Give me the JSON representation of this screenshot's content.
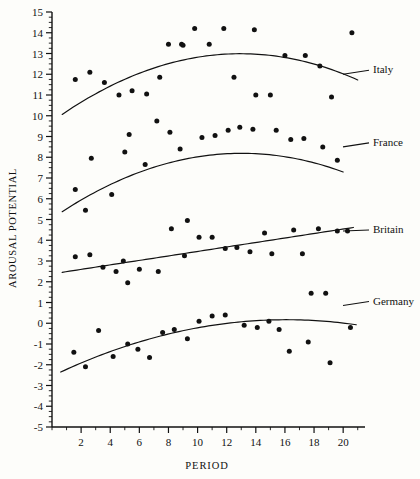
{
  "chart_data": {
    "type": "scatter",
    "title": "",
    "xlabel": "PERIOD",
    "ylabel": "AROUSAL POTENTIAL",
    "xlim": [
      0,
      21.5
    ],
    "ylim": [
      -5,
      15
    ],
    "xticks": [
      2,
      4,
      6,
      8,
      10,
      12,
      14,
      16,
      18,
      20
    ],
    "xtick_labels": [
      "2",
      "4",
      "6",
      "8",
      "10",
      "12",
      "14",
      "16",
      "18",
      "20"
    ],
    "xtick_minor_step": 1,
    "yticks": [
      -5,
      -4,
      -3,
      -2,
      -1,
      0,
      1,
      2,
      3,
      4,
      5,
      6,
      7,
      8,
      9,
      10,
      11,
      12,
      13,
      14,
      15
    ],
    "ytick_labels": [
      "-5",
      "-4",
      "-3",
      "-2",
      "-1",
      "0",
      "1",
      "2",
      "3",
      "4",
      "5",
      "6",
      "7",
      "8",
      "9",
      "10",
      "11",
      "12",
      "13",
      "14",
      "15"
    ],
    "ytick_minor_step": 0.25,
    "grid": false,
    "legend_position": "right-inline-labels",
    "marker": "filled-circle",
    "marker_color": "#111111",
    "line_color": "#111111",
    "series": [
      {
        "name": "Italy",
        "label": "Italy",
        "label_y": 12.05,
        "fit": {
          "type": "quadratic",
          "a": -0.0195,
          "b": 0.505,
          "c": 9.72
        },
        "points": [
          {
            "x": 1.6,
            "y": 11.75
          },
          {
            "x": 2.6,
            "y": 12.1
          },
          {
            "x": 3.6,
            "y": 11.6
          },
          {
            "x": 4.6,
            "y": 11.0
          },
          {
            "x": 5.5,
            "y": 11.2
          },
          {
            "x": 6.5,
            "y": 11.05
          },
          {
            "x": 8.0,
            "y": 13.45
          },
          {
            "x": 8.9,
            "y": 13.45
          },
          {
            "x": 7.4,
            "y": 11.85
          },
          {
            "x": 9.8,
            "y": 14.2
          },
          {
            "x": 10.8,
            "y": 13.45
          },
          {
            "x": 11.8,
            "y": 14.2
          },
          {
            "x": 9.0,
            "y": 13.4
          },
          {
            "x": 12.5,
            "y": 11.85
          },
          {
            "x": 13.9,
            "y": 14.15
          },
          {
            "x": 14.0,
            "y": 11.0
          },
          {
            "x": 15.0,
            "y": 11.0
          },
          {
            "x": 16.0,
            "y": 12.9
          },
          {
            "x": 17.4,
            "y": 12.9
          },
          {
            "x": 18.4,
            "y": 12.4
          },
          {
            "x": 19.2,
            "y": 10.9
          },
          {
            "x": 20.6,
            "y": 14.0
          }
        ]
      },
      {
        "name": "France",
        "label": "France",
        "label_y": 8.55,
        "fit": {
          "type": "quadratic",
          "a": -0.0185,
          "b": 0.482,
          "c": 5.05
        },
        "points": [
          {
            "x": 1.6,
            "y": 6.45
          },
          {
            "x": 2.3,
            "y": 5.45
          },
          {
            "x": 2.7,
            "y": 7.95
          },
          {
            "x": 4.1,
            "y": 6.2
          },
          {
            "x": 5.3,
            "y": 9.1
          },
          {
            "x": 5.0,
            "y": 8.25
          },
          {
            "x": 6.4,
            "y": 7.65
          },
          {
            "x": 7.2,
            "y": 9.75
          },
          {
            "x": 8.1,
            "y": 9.2
          },
          {
            "x": 8.8,
            "y": 8.4
          },
          {
            "x": 9.3,
            "y": 4.95
          },
          {
            "x": 10.3,
            "y": 8.95
          },
          {
            "x": 11.2,
            "y": 9.05
          },
          {
            "x": 12.1,
            "y": 9.3
          },
          {
            "x": 12.9,
            "y": 9.45
          },
          {
            "x": 13.8,
            "y": 9.35
          },
          {
            "x": 15.4,
            "y": 9.3
          },
          {
            "x": 16.4,
            "y": 8.85
          },
          {
            "x": 17.3,
            "y": 8.9
          },
          {
            "x": 18.6,
            "y": 8.5
          },
          {
            "x": 19.6,
            "y": 7.85
          }
        ]
      },
      {
        "name": "Britain",
        "label": "Britain",
        "label_y": 4.35,
        "fit": {
          "type": "linear",
          "a": 0.0,
          "b": 0.108,
          "c": 2.38
        },
        "points": [
          {
            "x": 1.6,
            "y": 3.2
          },
          {
            "x": 2.6,
            "y": 3.3
          },
          {
            "x": 3.5,
            "y": 2.7
          },
          {
            "x": 4.4,
            "y": 2.5
          },
          {
            "x": 4.9,
            "y": 3.0
          },
          {
            "x": 5.2,
            "y": 1.95
          },
          {
            "x": 6.0,
            "y": 2.6
          },
          {
            "x": 7.3,
            "y": 2.5
          },
          {
            "x": 8.2,
            "y": 4.55
          },
          {
            "x": 9.1,
            "y": 3.25
          },
          {
            "x": 10.1,
            "y": 4.15
          },
          {
            "x": 11.0,
            "y": 4.15
          },
          {
            "x": 11.9,
            "y": 3.6
          },
          {
            "x": 12.7,
            "y": 3.65
          },
          {
            "x": 13.6,
            "y": 3.45
          },
          {
            "x": 14.6,
            "y": 4.35
          },
          {
            "x": 15.1,
            "y": 3.35
          },
          {
            "x": 16.6,
            "y": 4.5
          },
          {
            "x": 17.2,
            "y": 3.35
          },
          {
            "x": 18.3,
            "y": 4.55
          },
          {
            "x": 19.6,
            "y": 4.45
          },
          {
            "x": 20.3,
            "y": 4.45
          }
        ]
      },
      {
        "name": "Germany",
        "label": "Germany",
        "label_y": 0.9,
        "fit": {
          "type": "quadratic",
          "a": -0.0105,
          "b": 0.338,
          "c": -2.55
        },
        "points": [
          {
            "x": 1.5,
            "y": -1.4
          },
          {
            "x": 2.3,
            "y": -2.1
          },
          {
            "x": 3.2,
            "y": -0.35
          },
          {
            "x": 4.2,
            "y": -1.6
          },
          {
            "x": 5.2,
            "y": -1.0
          },
          {
            "x": 5.9,
            "y": -1.25
          },
          {
            "x": 6.7,
            "y": -1.65
          },
          {
            "x": 7.6,
            "y": -0.45
          },
          {
            "x": 8.4,
            "y": -0.3
          },
          {
            "x": 9.3,
            "y": -0.75
          },
          {
            "x": 10.1,
            "y": 0.1
          },
          {
            "x": 11.0,
            "y": 0.35
          },
          {
            "x": 11.9,
            "y": 0.4
          },
          {
            "x": 13.2,
            "y": -0.1
          },
          {
            "x": 14.1,
            "y": -0.2
          },
          {
            "x": 14.9,
            "y": 0.1
          },
          {
            "x": 15.6,
            "y": -0.3
          },
          {
            "x": 16.3,
            "y": -1.35
          },
          {
            "x": 17.6,
            "y": -0.9
          },
          {
            "x": 17.8,
            "y": 1.45
          },
          {
            "x": 18.8,
            "y": 1.45
          },
          {
            "x": 19.1,
            "y": -1.9
          },
          {
            "x": 20.5,
            "y": -0.2
          }
        ]
      }
    ]
  }
}
